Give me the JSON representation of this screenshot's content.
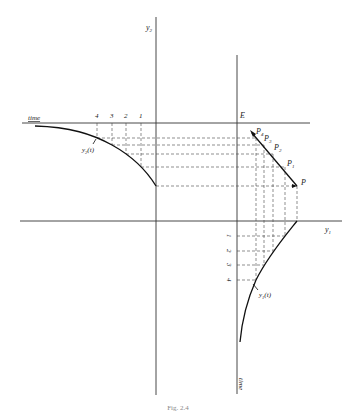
{
  "diagram": {
    "axes": {
      "y2_label": "y",
      "y2_sub": "2",
      "y1_label": "y",
      "y1_sub": "1",
      "time_top_label": "time",
      "time_bottom_label": "time",
      "origin_label": "E"
    },
    "curves": {
      "y2_label": "y",
      "y2_sub": "2",
      "y2_arg": "(t)",
      "y1_label": "y",
      "y1_sub": "1",
      "y1_arg": "(t)"
    },
    "time_ticks_top": [
      "4",
      "3",
      "2",
      "1"
    ],
    "time_ticks_right": [
      "1",
      "2",
      "3",
      "4"
    ],
    "points": {
      "P": "P",
      "P1": "P",
      "P1_sub": "1",
      "P2": "P",
      "P2_sub": "2",
      "P3": "P",
      "P3_sub": "3",
      "P4": "P",
      "P4_sub": "4"
    },
    "caption": "Fig. 2.4"
  }
}
